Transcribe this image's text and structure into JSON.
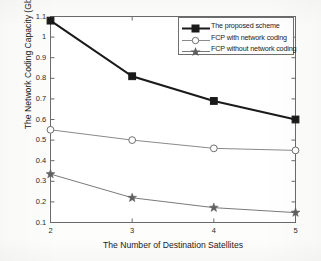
{
  "chart_data": {
    "type": "line",
    "title": "",
    "xlabel": "The Number of Destination Satellites",
    "ylabel": "The Network Coding Capacity (Gbits)",
    "x": [
      2,
      3,
      4,
      5
    ],
    "xtick_labels": [
      "2",
      "3",
      "4",
      "5"
    ],
    "ytick_labels": [
      "0.1",
      "0.2",
      "0.3",
      "0.4",
      "0.5",
      "0.6",
      "0.7",
      "0.8",
      "0.9",
      "1",
      "1.1"
    ],
    "ytick_values": [
      0.1,
      0.2,
      0.3,
      0.4,
      0.5,
      0.6,
      0.7,
      0.8,
      0.9,
      1.0,
      1.1
    ],
    "xlim": [
      2,
      5
    ],
    "ylim": [
      0.1,
      1.1
    ],
    "grid": false,
    "legend_position": "top-right",
    "series": [
      {
        "name": "The proposed scheme",
        "marker": "square-filled",
        "color": "#1a1a1a",
        "line_width": 2.0,
        "values": [
          1.08,
          0.81,
          0.69,
          0.6
        ]
      },
      {
        "name": "FCP with network coding",
        "marker": "circle-open",
        "color": "#8a8a8a",
        "line_width": 1.0,
        "values": [
          0.55,
          0.5,
          0.46,
          0.45
        ]
      },
      {
        "name": "FCP without network coding",
        "marker": "star-filled",
        "color": "#7a7a7a",
        "line_width": 1.0,
        "values": [
          0.335,
          0.22,
          0.172,
          0.148
        ]
      }
    ]
  },
  "axes": {
    "box_color": "#6a6a6a",
    "background": "#fdfdfb"
  }
}
